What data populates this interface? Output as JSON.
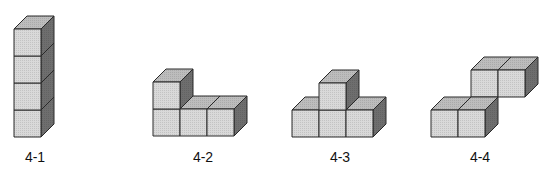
{
  "figures": [
    {
      "id": "4-1",
      "label": "4-1",
      "description": "vertical column of 4 cubes",
      "cubes": [
        [
          0,
          0,
          0
        ],
        [
          0,
          1,
          0
        ],
        [
          0,
          2,
          0
        ],
        [
          0,
          3,
          0
        ]
      ]
    },
    {
      "id": "4-2",
      "label": "4-2",
      "description": "L-shape: 3 cubes in a row with 1 stacked on the left",
      "cubes": [
        [
          0,
          0,
          0
        ],
        [
          1,
          0,
          0
        ],
        [
          2,
          0,
          0
        ],
        [
          0,
          1,
          0
        ]
      ]
    },
    {
      "id": "4-3",
      "label": "4-3",
      "description": "T-shape: 3 cubes in a row with 1 stacked in the middle",
      "cubes": [
        [
          0,
          0,
          0
        ],
        [
          1,
          0,
          0
        ],
        [
          2,
          0,
          0
        ],
        [
          1,
          1,
          0
        ]
      ]
    },
    {
      "id": "4-4",
      "label": "4-4",
      "description": "skew shape: 2 cubes front-bottom, 2 cubes stacked behind and shifted right",
      "cubes": [
        [
          0,
          0,
          0
        ],
        [
          1,
          0,
          0
        ],
        [
          1,
          1,
          1
        ],
        [
          2,
          1,
          1
        ]
      ]
    }
  ],
  "colors": {
    "front": "#d9d9d9",
    "top": "#bdbdbd",
    "side": "#6e6e6e",
    "edge": "#2a2a2a"
  }
}
